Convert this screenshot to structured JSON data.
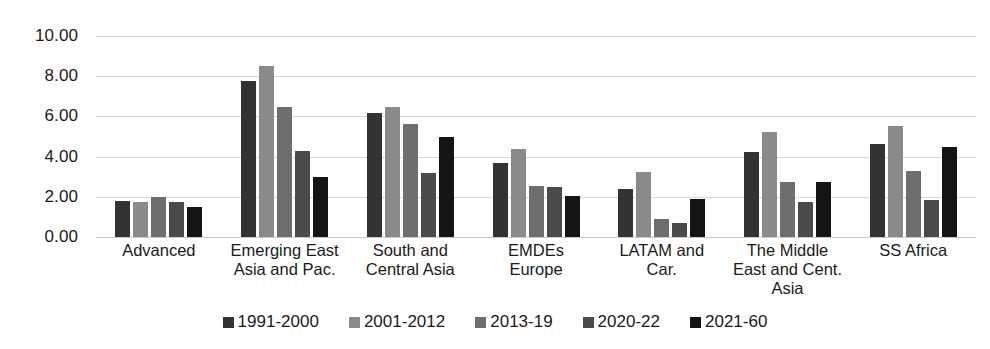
{
  "chart_data": {
    "type": "bar",
    "title": "",
    "subtitle": "",
    "xlabel": "",
    "ylabel": "",
    "ylim": [
      0,
      10
    ],
    "ytick_step": 2,
    "ytick_labels": [
      "10.00",
      "8.00",
      "6.00",
      "4.00",
      "2.00",
      "0.00"
    ],
    "ytick_values": [
      10,
      8,
      6,
      4,
      2,
      0
    ],
    "grid": true,
    "legend_position": "bottom",
    "orientation": "vertical",
    "categories": [
      "Advanced",
      "Emerging East\nAsia and Pac.",
      "South and\nCentral Asia",
      "EMDEs\nEurope",
      "LATAM and\nCar.",
      "The Middle\nEast and Cent.\nAsia",
      "SS Africa"
    ],
    "series": [
      {
        "name": "1991-2000",
        "color": "#333333",
        "values": [
          1.8,
          7.75,
          6.15,
          3.7,
          2.4,
          4.25,
          4.65
        ]
      },
      {
        "name": "2001-2012",
        "color": "#8a8a8a",
        "values": [
          1.75,
          8.5,
          6.45,
          4.4,
          3.25,
          5.2,
          5.5
        ]
      },
      {
        "name": "2013-19",
        "color": "#6e6e6e",
        "values": [
          2.0,
          6.45,
          5.6,
          2.55,
          0.9,
          2.75,
          3.3
        ]
      },
      {
        "name": "2020-22",
        "color": "#4a4a4a",
        "values": [
          1.75,
          4.3,
          3.2,
          2.5,
          0.7,
          1.75,
          1.85
        ]
      },
      {
        "name": "2021-60",
        "color": "#141414",
        "values": [
          1.5,
          3.0,
          5.0,
          2.05,
          1.9,
          2.75,
          4.5
        ]
      }
    ]
  }
}
